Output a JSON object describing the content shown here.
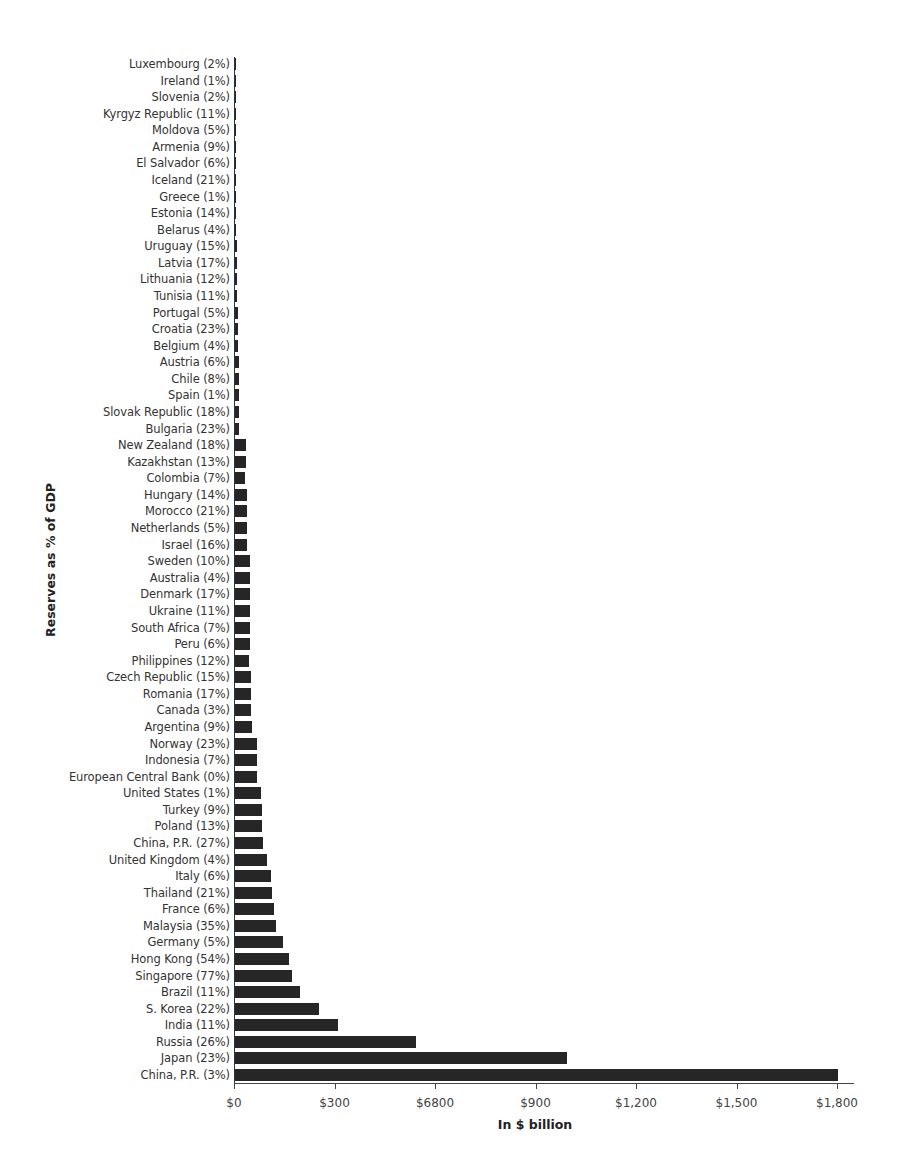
{
  "chart_data": {
    "type": "bar",
    "orientation": "horizontal",
    "title": "",
    "xlabel": "In $ billion",
    "ylabel": "Reserves as % of GDP",
    "xlim": [
      0,
      1800
    ],
    "grid": false,
    "legend": null,
    "x_ticks": [
      {
        "value": 0,
        "label": "$0"
      },
      {
        "value": 300,
        "label": "$300"
      },
      {
        "value": 600,
        "label": "$6800"
      },
      {
        "value": 900,
        "label": "$900"
      },
      {
        "value": 1200,
        "label": "$1,200"
      },
      {
        "value": 1500,
        "label": "$1,500"
      },
      {
        "value": 1800,
        "label": "$1,800"
      }
    ],
    "categories": [
      "Luxembourg (2%)",
      "Ireland (1%)",
      "Slovenia (2%)",
      "Kyrgyz Republic (11%)",
      "Moldova (5%)",
      "Armenia (9%)",
      "El Salvador (6%)",
      "Iceland (21%)",
      "Greece (1%)",
      "Estonia (14%)",
      "Belarus (4%)",
      "Uruguay (15%)",
      "Latvia (17%)",
      "Lithuania (12%)",
      "Tunisia (11%)",
      "Portugal (5%)",
      "Croatia (23%)",
      "Belgium (4%)",
      "Austria (6%)",
      "Chile (8%)",
      "Spain (1%)",
      "Slovak Republic (18%)",
      "Bulgaria (23%)",
      "New Zealand (18%)",
      "Kazakhstan (13%)",
      "Colombia (7%)",
      "Hungary (14%)",
      "Morocco (21%)",
      "Netherlands (5%)",
      "Israel (16%)",
      "Sweden (10%)",
      "Australia (4%)",
      "Denmark (17%)",
      "Ukraine (11%)",
      "South Africa (7%)",
      "Peru (6%)",
      "Philippines (12%)",
      "Czech Republic (15%)",
      "Romania (17%)",
      "Canada (3%)",
      "Argentina (9%)",
      "Norway (23%)",
      "Indonesia (7%)",
      "European Central Bank (0%)",
      "United States (1%)",
      "Turkey (9%)",
      "Poland (13%)",
      "China, P.R. (27%)",
      "United Kingdom (4%)",
      "Italy (6%)",
      "Thailand (21%)",
      "France (6%)",
      "Malaysia (35%)",
      "Germany (5%)",
      "Hong Kong (54%)",
      "Singapore (77%)",
      "Brazil (11%)",
      "S. Korea (22%)",
      "India (11%)",
      "Russia (26%)",
      "Japan (23%)",
      "China, P.R. (3%)"
    ],
    "values": [
      1,
      1,
      1,
      2,
      2,
      2,
      3,
      4,
      4,
      4,
      4,
      5,
      5,
      5,
      5,
      8,
      9,
      9,
      12,
      12,
      12,
      13,
      13,
      33,
      33,
      31,
      36,
      36,
      37,
      37,
      44,
      44,
      44,
      44,
      44,
      44,
      42,
      47,
      47,
      47,
      52,
      65,
      65,
      65,
      77,
      80,
      80,
      83,
      95,
      107,
      110,
      116,
      122,
      143,
      160,
      169,
      194,
      251,
      307,
      540,
      991,
      1800
    ],
    "bar_color": "#262626"
  }
}
